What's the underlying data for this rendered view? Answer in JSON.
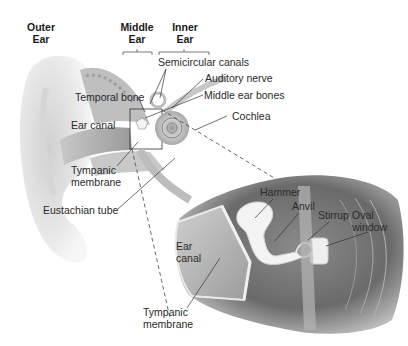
{
  "region_headers": [
    {
      "id": "outer",
      "label": "Outer\nEar"
    },
    {
      "id": "middle",
      "label": "Middle\nEar"
    },
    {
      "id": "inner",
      "label": "Inner\nEar"
    }
  ],
  "overview_labels": {
    "semicircular_canals": "Semicircular canals",
    "auditory_nerve": "Auditory nerve",
    "temporal_bone": "Temporal bone",
    "middle_ear_bones": "Middle ear bones",
    "ear_canal": "Ear canal",
    "cochlea": "Cochlea",
    "tympanic_membrane": "Tympanic\nmembrane",
    "eustachian_tube": "Eustachian tube"
  },
  "detail_labels": {
    "hammer": "Hammer",
    "anvil": "Anvil",
    "stirrup": "Stirrup",
    "oval_window": "Oval\nwindow",
    "ear_canal": "Ear\ncanal",
    "tympanic_membrane": "Tympanic\nmembrane"
  },
  "colors": {
    "background": "#ffffff",
    "tissue_light": "#e6e6e6",
    "tissue_mid": "#bdbdbd",
    "tissue_dark": "#6e6e6e",
    "bone": "#f2f2f2",
    "line": "#333333"
  }
}
